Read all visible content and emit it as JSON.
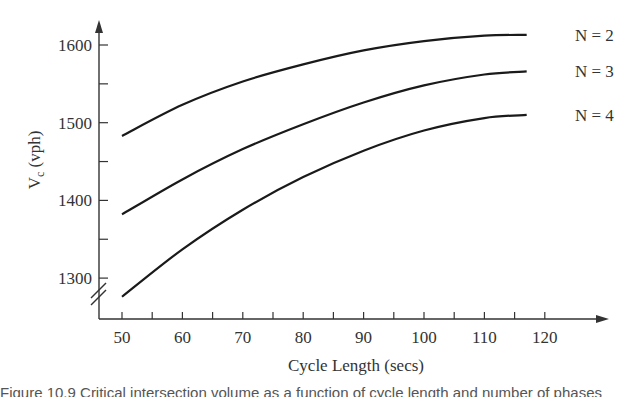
{
  "chart_data": {
    "type": "line",
    "title": "",
    "xlabel": "Cycle Length (secs)",
    "ylabel": "V_c (vph)",
    "ylabel_main": "V",
    "ylabel_sub": "c",
    "ylabel_unit": " (vph)",
    "xlim": [
      46,
      130
    ],
    "ylim": [
      1250,
      1630
    ],
    "x_ticks": [
      50,
      55,
      60,
      65,
      70,
      75,
      80,
      85,
      90,
      95,
      100,
      105,
      110,
      115,
      120
    ],
    "x_tick_labels": [
      "50",
      "60",
      "70",
      "80",
      "90",
      "100",
      "110",
      "120"
    ],
    "y_ticks": [
      1300,
      1350,
      1400,
      1450,
      1500,
      1550,
      1600
    ],
    "y_tick_labels": [
      "1300",
      "1400",
      "1500",
      "1600"
    ],
    "y_axis_break": true,
    "grid": false,
    "legend_position": "right, inline labels at line ends",
    "x": [
      50,
      60,
      70,
      80,
      90,
      100,
      110,
      117
    ],
    "series": [
      {
        "name": "N = 2",
        "values": [
          1483,
          1523,
          1553,
          1575,
          1593,
          1605,
          1612,
          1613
        ]
      },
      {
        "name": "N = 3",
        "values": [
          1382,
          1427,
          1466,
          1498,
          1526,
          1548,
          1562,
          1566
        ]
      },
      {
        "name": "N = 4",
        "values": [
          1276,
          1337,
          1388,
          1430,
          1464,
          1490,
          1506,
          1510
        ]
      }
    ]
  },
  "caption": "Figure 10.9  Critical intersection volume as a function of cycle length and number of phases"
}
